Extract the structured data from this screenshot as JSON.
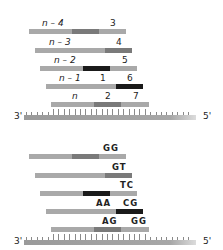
{
  "colors": {
    "bar": "#a9a9a9",
    "mid": "#7a7a7a",
    "dark": "#1a1a1a",
    "strand": "#9a9a9a"
  },
  "panels": [
    {
      "id": "top",
      "rows": [
        {
          "left_label": "n – 4",
          "right_labels": [
            "3"
          ],
          "x0": 29,
          "x1": 126,
          "y": 29,
          "segments": [
            {
              "x0": 72,
              "x1": 99,
              "tone": "mid"
            }
          ],
          "label_pos": [
            {
              "x": 42
            },
            {
              "x": 110
            }
          ]
        },
        {
          "left_label": "n – 3",
          "right_labels": [
            "4"
          ],
          "x0": 35,
          "x1": 132,
          "y": 48,
          "segments": [
            {
              "x0": 105,
              "x1": 132,
              "tone": "mid"
            }
          ],
          "label_pos": [
            {
              "x": 49
            },
            {
              "x": 116
            }
          ]
        },
        {
          "left_label": "n – 2",
          "right_labels": [
            "5"
          ],
          "x0": 40,
          "x1": 137,
          "y": 66,
          "segments": [
            {
              "x0": 83,
              "x1": 110,
              "tone": "dark"
            }
          ],
          "label_pos": [
            {
              "x": 54
            },
            {
              "x": 122
            }
          ]
        },
        {
          "left_label": "n – 1",
          "right_labels": [
            "1",
            "6"
          ],
          "x0": 46,
          "x1": 143,
          "y": 84,
          "segments": [
            {
              "x0": 116,
              "x1": 143,
              "tone": "dark"
            }
          ],
          "label_pos": [
            {
              "x": 59
            },
            {
              "x": 100
            },
            {
              "x": 127
            }
          ]
        },
        {
          "left_label": "n",
          "right_labels": [
            "2",
            "7"
          ],
          "x0": 51,
          "x1": 149,
          "y": 102,
          "segments": [
            {
              "x0": 94,
              "x1": 121,
              "tone": "mid"
            }
          ],
          "label_pos": [
            {
              "x": 72
            },
            {
              "x": 105
            },
            {
              "x": 133
            }
          ]
        }
      ],
      "strand": {
        "x0": 24,
        "x1": 196,
        "y": 115,
        "left_end": "3'",
        "right_end": "5'"
      }
    },
    {
      "id": "bottom",
      "rows": [
        {
          "left_label": "",
          "right_labels": [
            "GG"
          ],
          "x0": 29,
          "x1": 126,
          "y": 29,
          "segments": [
            {
              "x0": 72,
              "x1": 99,
              "tone": "mid"
            }
          ],
          "label_pos": [
            {
              "x": 0
            },
            {
              "x": 103
            }
          ]
        },
        {
          "left_label": "",
          "right_labels": [
            "GT"
          ],
          "x0": 35,
          "x1": 132,
          "y": 48,
          "segments": [
            {
              "x0": 105,
              "x1": 132,
              "tone": "mid"
            }
          ],
          "label_pos": [
            {
              "x": 0
            },
            {
              "x": 112
            }
          ]
        },
        {
          "left_label": "",
          "right_labels": [
            "TC"
          ],
          "x0": 40,
          "x1": 137,
          "y": 66,
          "segments": [
            {
              "x0": 83,
              "x1": 110,
              "tone": "dark"
            }
          ],
          "label_pos": [
            {
              "x": 0
            },
            {
              "x": 120
            }
          ]
        },
        {
          "left_label": "",
          "right_labels": [
            "AA",
            "CG"
          ],
          "x0": 46,
          "x1": 143,
          "y": 84,
          "segments": [
            {
              "x0": 116,
              "x1": 143,
              "tone": "dark"
            }
          ],
          "label_pos": [
            {
              "x": 0
            },
            {
              "x": 96
            },
            {
              "x": 123
            }
          ]
        },
        {
          "left_label": "",
          "right_labels": [
            "AG",
            "GG"
          ],
          "x0": 51,
          "x1": 149,
          "y": 102,
          "segments": [
            {
              "x0": 94,
              "x1": 121,
              "tone": "mid"
            }
          ],
          "label_pos": [
            {
              "x": 0
            },
            {
              "x": 102
            },
            {
              "x": 131
            }
          ]
        }
      ],
      "strand": {
        "x0": 24,
        "x1": 196,
        "y": 115,
        "left_end": "3'",
        "right_end": "5'"
      }
    }
  ]
}
